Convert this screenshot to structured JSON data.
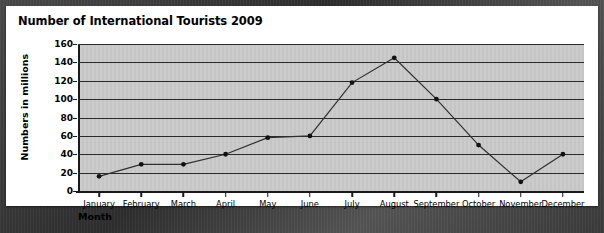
{
  "chart_data": {
    "type": "line",
    "title": "Number of International Tourists 2009",
    "xlabel": "Month",
    "ylabel": "Numbers in millions",
    "categories": [
      "January",
      "February",
      "March",
      "April",
      "May",
      "June",
      "July",
      "August",
      "September",
      "October",
      "November",
      "December"
    ],
    "values": [
      16,
      29,
      29,
      40,
      58,
      60,
      118,
      145,
      100,
      50,
      10,
      40
    ],
    "series": [
      {
        "name": "International tourists",
        "values": [
          16,
          29,
          29,
          40,
          58,
          60,
          118,
          145,
          100,
          50,
          10,
          40
        ]
      }
    ],
    "ylim": [
      0,
      160
    ],
    "yticks": [
      0,
      20,
      40,
      60,
      80,
      100,
      120,
      140,
      160
    ],
    "ytick_labels": [
      "0",
      "20",
      "40",
      "60",
      "80",
      "100",
      "120",
      "140",
      "160"
    ],
    "grid": true,
    "legend": false,
    "marker": "circle",
    "line_color": "#2f2f2f",
    "marker_color": "#111111",
    "plot_background": "#c9c9c9",
    "card_background": "#ffffff"
  }
}
